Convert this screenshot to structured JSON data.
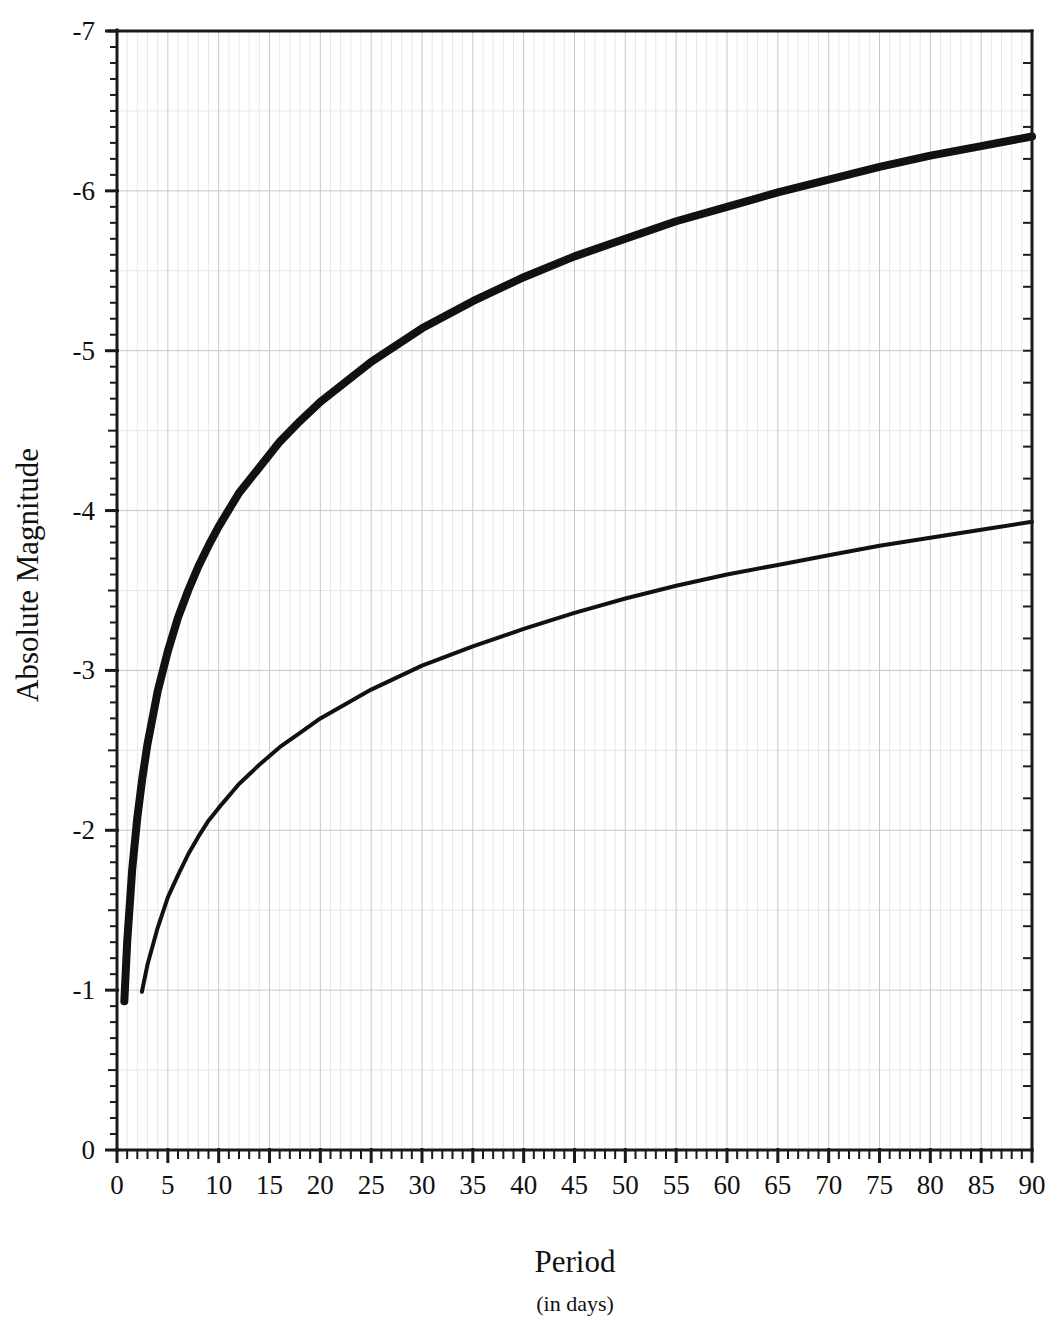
{
  "chart_data": {
    "type": "line",
    "title": "",
    "subtitle": "",
    "xlabel": "Period",
    "xlabel_sub": "(in days)",
    "ylabel": "Absolute Magnitude",
    "xlim": [
      0,
      90
    ],
    "ylim": [
      0,
      -7
    ],
    "y_inverted": true,
    "grid": true,
    "grid_major_x_step": 5,
    "grid_major_y_step": 1,
    "legend": "none",
    "x_ticks": [
      0,
      5,
      10,
      15,
      20,
      25,
      30,
      35,
      40,
      45,
      50,
      55,
      60,
      65,
      70,
      75,
      80,
      85,
      90
    ],
    "x_tick_labels": [
      "0",
      "5",
      "10",
      "15",
      "20",
      "25",
      "30",
      "35",
      "40",
      "45",
      "50",
      "55",
      "60",
      "65",
      "70",
      "75",
      "80",
      "85",
      "90"
    ],
    "x_minor_step": 1,
    "y_ticks": [
      0,
      -1,
      -2,
      -3,
      -4,
      -5,
      -6,
      -7
    ],
    "y_tick_labels": [
      "0",
      "-1",
      "-2",
      "-3",
      "-4",
      "-5",
      "-6",
      "-7"
    ],
    "y_minor_step": 0.1,
    "series": [
      {
        "name": "Type I Cepheids",
        "style": "thick",
        "stroke_width": 8,
        "color": "#111111",
        "relation": "M = -1.30 - 2.60*log10(P)",
        "x_start": 0.72,
        "x_end": 90,
        "x": [
          0.72,
          1,
          1.5,
          2,
          2.5,
          3,
          4,
          5,
          6,
          7,
          8,
          9,
          10,
          12,
          14,
          16,
          18,
          20,
          25,
          30,
          35,
          40,
          45,
          50,
          55,
          60,
          65,
          70,
          75,
          80,
          85,
          90
        ],
        "y": [
          -0.93,
          -1.3,
          -1.76,
          -2.08,
          -2.33,
          -2.54,
          -2.87,
          -3.12,
          -3.33,
          -3.5,
          -3.65,
          -3.78,
          -3.9,
          -4.11,
          -4.27,
          -4.43,
          -4.56,
          -4.68,
          -4.93,
          -5.14,
          -5.31,
          -5.46,
          -5.59,
          -5.7,
          -5.81,
          -5.9,
          -5.99,
          -6.07,
          -6.15,
          -6.22,
          -6.28,
          -6.34
        ]
      },
      {
        "name": "Type II Cepheids",
        "style": "thin",
        "stroke_width": 4,
        "color": "#111111",
        "relation": "M = -0.26 - 1.88*log10(P)",
        "x_start": 2.45,
        "x_end": 90,
        "x": [
          2.45,
          3,
          4,
          5,
          6,
          7,
          8,
          9,
          10,
          12,
          14,
          16,
          18,
          20,
          25,
          30,
          35,
          40,
          45,
          50,
          55,
          60,
          65,
          70,
          75,
          80,
          85,
          90
        ],
        "y": [
          -0.99,
          -1.16,
          -1.39,
          -1.58,
          -1.72,
          -1.85,
          -1.96,
          -2.06,
          -2.14,
          -2.29,
          -2.41,
          -2.52,
          -2.61,
          -2.7,
          -2.88,
          -3.03,
          -3.15,
          -3.26,
          -3.36,
          -3.45,
          -3.53,
          -3.6,
          -3.66,
          -3.72,
          -3.78,
          -3.83,
          -3.88,
          -3.93
        ]
      }
    ]
  },
  "axis": {
    "y_title": "Absolute Magnitude",
    "x_title": "Period",
    "x_subtitle": "(in days)"
  }
}
